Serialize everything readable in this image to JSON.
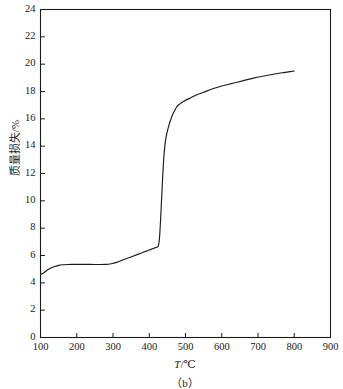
{
  "chart_data": {
    "type": "line",
    "title": "",
    "caption": "（b）",
    "xlabel": "T/℃",
    "xlabel_italic_part": "T",
    "xlabel_unit_part": "/℃",
    "ylabel": "质量损失/%",
    "xlim": [
      100,
      900
    ],
    "ylim": [
      0,
      24
    ],
    "xticks": [
      100,
      200,
      300,
      400,
      500,
      600,
      700,
      800,
      900
    ],
    "yticks": [
      0,
      2,
      4,
      6,
      8,
      10,
      12,
      14,
      16,
      18,
      20,
      22,
      24
    ],
    "xtick_labels": [
      "100",
      "200",
      "300",
      "400",
      "500",
      "600",
      "700",
      "800",
      "900"
    ],
    "ytick_labels": [
      "0",
      "2",
      "4",
      "6",
      "8",
      "10",
      "12",
      "14",
      "16",
      "18",
      "20",
      "22",
      "24"
    ],
    "grid": false,
    "legend": false,
    "line_color": "#1a1a1a",
    "series": [
      {
        "name": "质量损失",
        "x": [
          100,
          110,
          120,
          130,
          140,
          150,
          160,
          175,
          190,
          210,
          230,
          250,
          265,
          280,
          295,
          310,
          325,
          340,
          355,
          370,
          385,
          395,
          405,
          412,
          418,
          422,
          425,
          428,
          430,
          432,
          434,
          436,
          438,
          440,
          443,
          446,
          450,
          455,
          460,
          465,
          470,
          475,
          480,
          485,
          490,
          500,
          515,
          530,
          550,
          575,
          600,
          630,
          660,
          690,
          720,
          750,
          775,
          800
        ],
        "y": [
          4.6,
          4.75,
          4.95,
          5.1,
          5.2,
          5.28,
          5.32,
          5.34,
          5.35,
          5.35,
          5.35,
          5.34,
          5.34,
          5.35,
          5.4,
          5.5,
          5.65,
          5.8,
          5.95,
          6.1,
          6.25,
          6.35,
          6.45,
          6.52,
          6.58,
          6.62,
          6.7,
          7.2,
          8.0,
          9.0,
          10.1,
          11.2,
          12.2,
          13.1,
          14.0,
          14.6,
          15.1,
          15.6,
          16.0,
          16.35,
          16.6,
          16.85,
          17.0,
          17.1,
          17.2,
          17.35,
          17.55,
          17.75,
          17.95,
          18.2,
          18.4,
          18.6,
          18.8,
          19.0,
          19.15,
          19.3,
          19.4,
          19.5
        ]
      }
    ]
  }
}
